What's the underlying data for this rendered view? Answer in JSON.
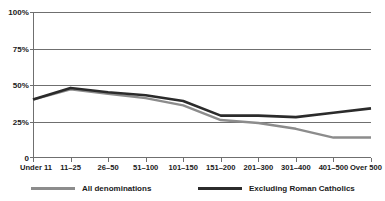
{
  "chart_data": {
    "type": "line",
    "title": "",
    "xlabel": "",
    "ylabel": "",
    "ylim": [
      0,
      100
    ],
    "yticks": [
      0,
      25,
      50,
      75,
      100
    ],
    "ytick_labels": [
      "0",
      "25%",
      "50%",
      "75%",
      "100%"
    ],
    "grid": true,
    "legend_position": "bottom",
    "categories": [
      "Under 11",
      "11–25",
      "26–50",
      "51–100",
      "101–150",
      "151–200",
      "201–300",
      "301–400",
      "401–500",
      "Over 500"
    ],
    "series": [
      {
        "name": "All denominations",
        "color": "#8c8c8c",
        "values": [
          40,
          47,
          44,
          41,
          36,
          26,
          24,
          20,
          14,
          14
        ]
      },
      {
        "name": "Excluding Roman Catholics",
        "color": "#2b2b2b",
        "values": [
          40,
          48,
          45,
          43,
          39,
          29,
          29,
          28,
          31,
          34
        ]
      }
    ]
  },
  "axes": {
    "y_labels": [
      "100%",
      "75%",
      "50%",
      "25%",
      "0"
    ],
    "x_labels": [
      "Under 11",
      "11–25",
      "26–50",
      "51–100",
      "101–150",
      "151–200",
      "201–300",
      "301–400",
      "401–500",
      "Over 500"
    ],
    "axis_color": "#6f6f6f",
    "grid_color": "#6f6f6f"
  },
  "legend": {
    "items": [
      {
        "label": "All denominations",
        "color": "#8c8c8c"
      },
      {
        "label": "Excluding Roman Catholics",
        "color": "#2b2b2b"
      }
    ]
  }
}
